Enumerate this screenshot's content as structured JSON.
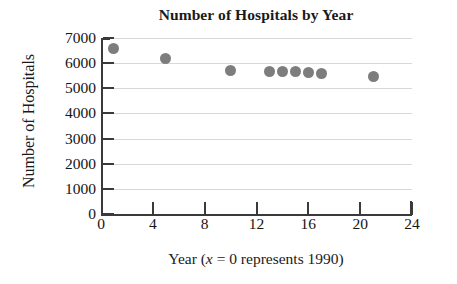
{
  "chart_data": {
    "type": "scatter",
    "title": "Number of Hospitals by Year",
    "xlabel_parts": {
      "prefix": "Year (",
      "variable": "x",
      "suffix": " = 0 represents 1990)"
    },
    "xlabel": "Year (x = 0 represents 1990)",
    "ylabel": "Number of Hospitals",
    "xlim": [
      0,
      24
    ],
    "ylim": [
      0,
      7000
    ],
    "xticks": [
      0,
      4,
      8,
      12,
      16,
      20,
      24
    ],
    "xtick_labels": [
      "0",
      "4",
      "8",
      "12",
      "16",
      "20",
      "24"
    ],
    "yticks": [
      0,
      1000,
      2000,
      3000,
      4000,
      5000,
      6000,
      7000
    ],
    "ytick_labels": [
      "0",
      "1000",
      "2000",
      "3000",
      "4000",
      "5000",
      "6000",
      "7000"
    ],
    "grid": true,
    "grid_axis": "y",
    "legend": false,
    "marker_color": "#7d7d7d",
    "axis_color": "#3a3a3a",
    "grid_color": "#d8d8d8",
    "points": [
      {
        "x": 1,
        "y": 6600
      },
      {
        "x": 5,
        "y": 6200
      },
      {
        "x": 10,
        "y": 5700
      },
      {
        "x": 13,
        "y": 5650
      },
      {
        "x": 14,
        "y": 5650
      },
      {
        "x": 15,
        "y": 5650
      },
      {
        "x": 16,
        "y": 5640
      },
      {
        "x": 17,
        "y": 5600
      },
      {
        "x": 21,
        "y": 5450
      }
    ]
  }
}
